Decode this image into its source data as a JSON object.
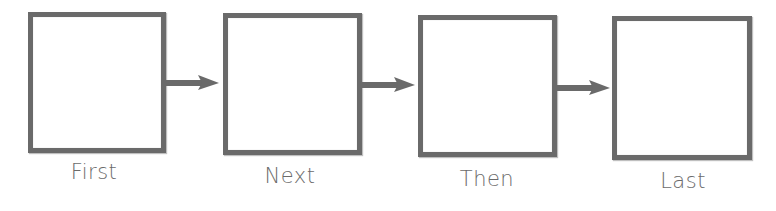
{
  "diagram": {
    "type": "sequence-flow",
    "colors": {
      "box_border": "#6a6a6a",
      "arrow": "#6a6a6a",
      "label": "#6b6b6b",
      "background": "#ffffff"
    },
    "steps": [
      {
        "label": "First"
      },
      {
        "label": "Next"
      },
      {
        "label": "Then"
      },
      {
        "label": "Last"
      }
    ],
    "connectors": [
      {
        "from": "First",
        "to": "Next",
        "icon": "arrow-right-icon"
      },
      {
        "from": "Next",
        "to": "Then",
        "icon": "arrow-right-icon"
      },
      {
        "from": "Then",
        "to": "Last",
        "icon": "arrow-right-icon"
      }
    ]
  }
}
